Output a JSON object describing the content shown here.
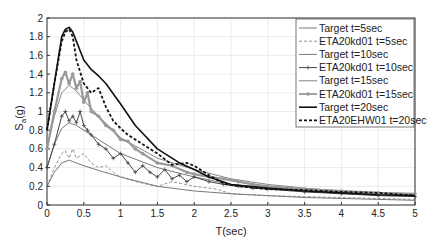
{
  "chart_data": {
    "type": "line",
    "title": "",
    "xlabel": "T(sec)",
    "ylabel": "S_a(g)",
    "ylabel_main": "S",
    "ylabel_sub": "a",
    "ylabel_tail": "(g)",
    "xlim": [
      0,
      5
    ],
    "ylim": [
      0,
      2
    ],
    "grid": true,
    "legend_position": "upper right",
    "xticks": [
      "0",
      "0.5",
      "1",
      "1.5",
      "2",
      "2.5",
      "3",
      "3.5",
      "4",
      "4.5",
      "5"
    ],
    "yticks": [
      "0",
      "0.2",
      "0.4",
      "0.6",
      "0.8",
      "1",
      "1.2",
      "1.4",
      "1.6",
      "1.8",
      "2"
    ],
    "series": [
      {
        "name": "Target t=5sec",
        "color": "#555555",
        "style": "solid-thin",
        "x": [
          0,
          0.1,
          0.2,
          0.3,
          0.4,
          0.5,
          0.7,
          1.0,
          1.5,
          2.0,
          2.5,
          3.0,
          3.5,
          4.0,
          4.5,
          5.0
        ],
        "y": [
          0.2,
          0.35,
          0.45,
          0.48,
          0.45,
          0.42,
          0.37,
          0.3,
          0.2,
          0.15,
          0.12,
          0.1,
          0.08,
          0.07,
          0.06,
          0.05
        ]
      },
      {
        "name": "ETA20kd01 t=5sec",
        "color": "#777777",
        "style": "dashed-thin",
        "x": [
          0,
          0.1,
          0.2,
          0.25,
          0.3,
          0.35,
          0.4,
          0.5,
          0.6,
          0.7,
          0.8,
          0.9,
          1.0,
          1.2,
          1.5,
          1.7,
          2.0,
          2.3,
          2.5,
          3.0,
          3.5,
          4.0,
          4.5,
          5.0
        ],
        "y": [
          0.2,
          0.4,
          0.55,
          0.58,
          0.5,
          0.6,
          0.5,
          0.55,
          0.45,
          0.4,
          0.42,
          0.35,
          0.3,
          0.25,
          0.2,
          0.25,
          0.2,
          0.17,
          0.12,
          0.1,
          0.09,
          0.08,
          0.07,
          0.06
        ]
      },
      {
        "name": "Target t=10sec",
        "color": "#555555",
        "style": "solid-thin",
        "x": [
          0,
          0.1,
          0.2,
          0.3,
          0.4,
          0.5,
          0.7,
          1.0,
          1.5,
          2.0,
          2.5,
          3.0,
          3.5,
          4.0,
          4.5,
          5.0
        ],
        "y": [
          0.4,
          0.65,
          0.82,
          0.88,
          0.85,
          0.8,
          0.7,
          0.55,
          0.4,
          0.3,
          0.22,
          0.18,
          0.15,
          0.13,
          0.11,
          0.1
        ]
      },
      {
        "name": "ETA20kd01 t=10sec",
        "color": "#444444",
        "style": "solid-plus",
        "x": [
          0,
          0.1,
          0.2,
          0.25,
          0.3,
          0.35,
          0.4,
          0.45,
          0.5,
          0.55,
          0.6,
          0.7,
          0.8,
          0.9,
          1.0,
          1.1,
          1.2,
          1.3,
          1.4,
          1.5,
          1.6,
          1.7,
          1.8,
          1.9,
          2.0,
          2.2,
          2.4,
          2.6,
          2.8,
          3.0,
          3.5,
          4.0,
          4.5,
          5.0
        ],
        "y": [
          0.4,
          0.65,
          0.95,
          1.0,
          0.9,
          0.95,
          0.88,
          1.0,
          0.85,
          0.8,
          0.75,
          0.65,
          0.6,
          0.5,
          0.55,
          0.45,
          0.35,
          0.42,
          0.35,
          0.3,
          0.38,
          0.28,
          0.32,
          0.25,
          0.3,
          0.25,
          0.22,
          0.2,
          0.18,
          0.17,
          0.14,
          0.12,
          0.1,
          0.09
        ]
      },
      {
        "name": "Target t=15sec",
        "color": "#666666",
        "style": "solid-thin",
        "x": [
          0,
          0.1,
          0.2,
          0.3,
          0.4,
          0.5,
          0.7,
          1.0,
          1.5,
          2.0,
          2.5,
          3.0,
          3.5,
          4.0,
          4.5,
          5.0
        ],
        "y": [
          0.6,
          0.95,
          1.2,
          1.28,
          1.22,
          1.12,
          0.95,
          0.72,
          0.5,
          0.38,
          0.28,
          0.22,
          0.18,
          0.15,
          0.13,
          0.12
        ]
      },
      {
        "name": "ETA20kd01 t=15sec",
        "color": "#999999",
        "style": "thick-marker",
        "x": [
          0,
          0.1,
          0.2,
          0.25,
          0.3,
          0.35,
          0.4,
          0.45,
          0.5,
          0.55,
          0.6,
          0.7,
          0.8,
          0.9,
          1.0,
          1.1,
          1.2,
          1.3,
          1.5,
          1.7,
          1.9,
          2.0,
          2.2,
          2.4,
          2.6,
          2.8,
          3.0,
          3.5,
          4.0,
          4.5,
          5.0
        ],
        "y": [
          0.6,
          1.0,
          1.35,
          1.42,
          1.3,
          1.4,
          1.25,
          1.32,
          1.1,
          1.2,
          1.0,
          0.95,
          0.85,
          0.8,
          0.7,
          0.68,
          0.6,
          0.55,
          0.45,
          0.42,
          0.35,
          0.33,
          0.3,
          0.28,
          0.25,
          0.22,
          0.2,
          0.17,
          0.15,
          0.13,
          0.12
        ]
      },
      {
        "name": "Target t=20sec",
        "color": "#111111",
        "style": "solid-thick",
        "x": [
          0,
          0.1,
          0.2,
          0.25,
          0.3,
          0.35,
          0.4,
          0.5,
          0.6,
          0.7,
          0.8,
          1.0,
          1.2,
          1.5,
          1.8,
          2.0,
          2.2,
          2.5,
          3.0,
          3.5,
          4.0,
          4.5,
          5.0
        ],
        "y": [
          0.8,
          1.3,
          1.8,
          1.88,
          1.9,
          1.85,
          1.75,
          1.55,
          1.45,
          1.38,
          1.3,
          1.08,
          0.85,
          0.6,
          0.45,
          0.38,
          0.3,
          0.22,
          0.18,
          0.15,
          0.13,
          0.11,
          0.1
        ]
      },
      {
        "name": "ETA20EHW01 t=20sec",
        "color": "#111111",
        "style": "dashed-thick",
        "x": [
          0,
          0.1,
          0.2,
          0.25,
          0.3,
          0.35,
          0.4,
          0.5,
          0.6,
          0.7,
          0.8,
          0.9,
          1.0,
          1.1,
          1.3,
          1.5,
          1.7,
          1.9,
          2.0,
          2.2,
          2.4,
          2.6,
          3.0,
          3.5,
          4.0,
          4.5,
          5.0
        ],
        "y": [
          0.8,
          1.3,
          1.75,
          1.85,
          1.88,
          1.8,
          1.55,
          1.3,
          1.2,
          1.25,
          1.05,
          0.9,
          0.82,
          0.75,
          0.65,
          0.55,
          0.43,
          0.45,
          0.42,
          0.32,
          0.23,
          0.2,
          0.17,
          0.16,
          0.14,
          0.13,
          0.1
        ]
      }
    ]
  },
  "legend": {
    "items": [
      {
        "label": "Target t=5sec"
      },
      {
        "label": "ETA20kd01 t=5sec"
      },
      {
        "label": "Target t=10sec"
      },
      {
        "label": "ETA20kd01 t=10sec"
      },
      {
        "label": "Target t=15sec"
      },
      {
        "label": "ETA20kd01 t=15sec"
      },
      {
        "label": "Target  t=20sec"
      },
      {
        "label": "ETA20EHW01  t=20sec"
      }
    ]
  }
}
